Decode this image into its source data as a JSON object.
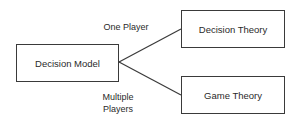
{
  "diagram": {
    "root": {
      "label": "Decision Model"
    },
    "children": [
      {
        "label": "Decision Theory",
        "edge_label": "One Player"
      },
      {
        "label": "Game Theory",
        "edge_label_line1": "Multiple",
        "edge_label_line2": "Players"
      }
    ],
    "colors": {
      "stroke": "#3a3a3a",
      "text": "#2a2a2a",
      "background": "#ffffff"
    }
  }
}
